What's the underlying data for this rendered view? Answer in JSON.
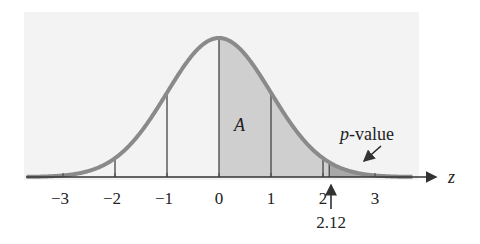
{
  "figure": {
    "type": "standard-normal-curve",
    "axis_label": "z",
    "tick_labels": [
      "−3",
      "−2",
      "−1",
      "0",
      "1",
      "2",
      "3"
    ],
    "tick_values": [
      -3,
      -2,
      -1,
      0,
      1,
      2,
      3
    ],
    "marker": {
      "value": 2.12,
      "label": "2.12"
    },
    "region_label": "A",
    "tail_label_italic": "p",
    "tail_label_rest": "-value",
    "colors": {
      "curve": "#8a8a8a",
      "area_A": "#cfcfcf",
      "p_value_area": "#a8a8a8",
      "panel": "#f3f3f3",
      "lines": "#444444"
    }
  },
  "chart_data": {
    "type": "area",
    "title": "",
    "xlabel": "z",
    "ylabel": "",
    "x_ticks": [
      -3,
      -2,
      -1,
      0,
      1,
      2,
      3
    ],
    "xlim": [
      -3.7,
      3.8
    ],
    "curve": "standard normal density",
    "shaded_regions": [
      {
        "name": "A",
        "from": 0,
        "to": 2.12
      },
      {
        "name": "p-value",
        "from": 2.12,
        "to": "inf"
      }
    ],
    "vertical_lines_at": [
      -2,
      -1,
      0,
      1,
      2,
      2.12
    ],
    "annotations": [
      {
        "text": "A",
        "x": 0.35
      },
      {
        "text": "p-value",
        "x": 2.9,
        "points_to": "right tail"
      },
      {
        "text": "2.12",
        "x": 2.12,
        "arrow": "up"
      }
    ],
    "grid": false,
    "legend": "none"
  }
}
